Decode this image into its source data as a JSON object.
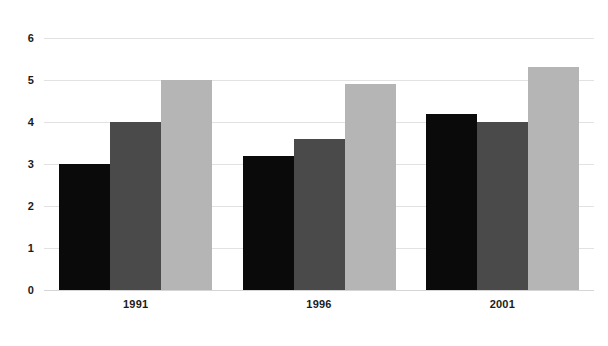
{
  "chart_data": {
    "type": "bar",
    "title": "",
    "subtitle": "",
    "xlabel": "",
    "ylabel": "",
    "categories": [
      "1991",
      "1996",
      "2001"
    ],
    "series": [
      {
        "name": "series-1",
        "color": "#0a0a0a",
        "values": [
          3.0,
          3.2,
          4.2
        ]
      },
      {
        "name": "series-2",
        "color": "#4a4a4a",
        "values": [
          4.0,
          3.6,
          4.0
        ]
      },
      {
        "name": "series-3",
        "color": "#b5b5b5",
        "values": [
          5.0,
          4.9,
          5.3
        ]
      }
    ],
    "ylim": [
      0,
      6
    ],
    "yticks": [
      0,
      1,
      2,
      3,
      4,
      5,
      6
    ],
    "ytick_labels": [
      "0",
      "1",
      "2",
      "3",
      "4",
      "5",
      "6"
    ],
    "xtick_labels": [
      "1991",
      "1996",
      "2001"
    ],
    "grid": true,
    "grid_axis": "y",
    "legend": false,
    "legend_position": "none",
    "background_color": "#ffffff",
    "gridline_color": "#e2e2e2",
    "tick_label_color": "#1b1b1b",
    "annotations": []
  }
}
